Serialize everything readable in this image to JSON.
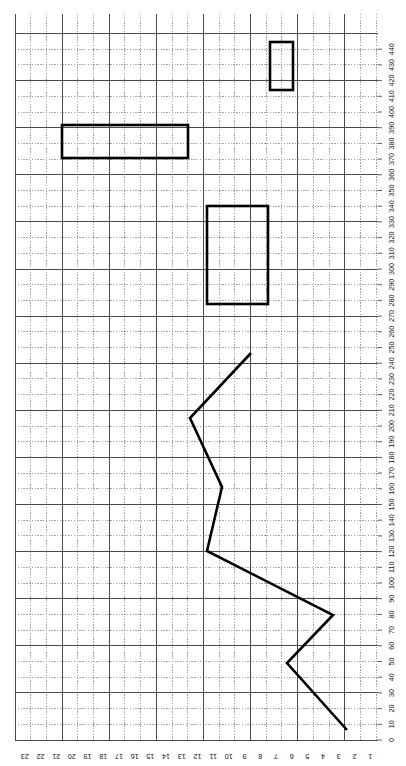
{
  "document": {
    "title": "Graph paper plot (rotated 90 degrees)",
    "orientation": "rotated-90",
    "background_color": "#ffffff"
  },
  "grid": {
    "minor_color": "#9a9a9a",
    "major_color": "#4a4a4a",
    "minor_style": "dotted",
    "major_style": "solid",
    "cell_size_px": 15.7,
    "major_every_cells": 3,
    "left_px": 15,
    "top_px": 14,
    "right_px": 378,
    "bottom_px": 740,
    "cols": 23,
    "rows": 44
  },
  "axes": {
    "horizontal": {
      "label_orientation": "upside-down",
      "direction": "right-to-left",
      "unit_per_cell": 1,
      "ticks": [
        "1",
        "2",
        "3",
        "4",
        "5",
        "6",
        "7",
        "8",
        "9",
        "10",
        "11",
        "12",
        "13",
        "14",
        "15",
        "16",
        "17",
        "18",
        "19",
        "20",
        "21",
        "22",
        "23"
      ]
    },
    "vertical": {
      "position": "right",
      "label_orientation": "rotated-90",
      "direction": "bottom-to-top",
      "unit_per_cell": 10,
      "ticks": [
        "0",
        "10",
        "20",
        "30",
        "40",
        "50",
        "60",
        "70",
        "80",
        "90",
        "100",
        "110",
        "120",
        "130",
        "140",
        "150",
        "160",
        "170",
        "180",
        "190",
        "200",
        "210",
        "220",
        "230",
        "240",
        "250",
        "260",
        "270",
        "280",
        "290",
        "300",
        "310",
        "320",
        "330",
        "340",
        "350",
        "360",
        "370",
        "380",
        "390",
        "400",
        "410",
        "420",
        "430",
        "440"
      ]
    }
  },
  "chart_data": {
    "type": "line",
    "title": "",
    "xlabel": "",
    "ylabel": "",
    "xlim": [
      0,
      23
    ],
    "ylim": [
      0,
      440
    ],
    "grid": true,
    "legend": "none",
    "stroke_color": "#000000",
    "stroke_width_px": 2.6,
    "note": "Axis values read from rotated labels; x increases right-to-left, y increases bottom-to-top",
    "series": [
      {
        "name": "zigzag-polyline",
        "x": [
          7.5,
          11.5,
          10.5,
          11.5,
          3.5,
          6.5,
          2.0
        ],
        "y": [
          240,
          200,
          155,
          115,
          75,
          50,
          10
        ]
      }
    ],
    "rectangles": [
      {
        "name": "rect-small-top-right",
        "x": 5.5,
        "y": 400,
        "width": 1.5,
        "height": 30
      },
      {
        "name": "rect-wide-upper-left",
        "x": 14.5,
        "y": 362,
        "width": 8.0,
        "height": 20
      },
      {
        "name": "rect-tall-middle",
        "x": 8.0,
        "y": 272,
        "width": 4.0,
        "height": 62
      }
    ]
  },
  "polyline_px": {
    "points": "251,353 190,418 222,487 207,551 333,615 287,663 347,730"
  },
  "rectangles_px": [
    {
      "name": "rect-small-top-right",
      "x": 270,
      "y": 42,
      "width": 23,
      "height": 48
    },
    {
      "name": "rect-wide-upper-left",
      "x": 62,
      "y": 125,
      "width": 126,
      "height": 33
    },
    {
      "name": "rect-tall-middle",
      "x": 207,
      "y": 206,
      "width": 61,
      "height": 98
    }
  ]
}
